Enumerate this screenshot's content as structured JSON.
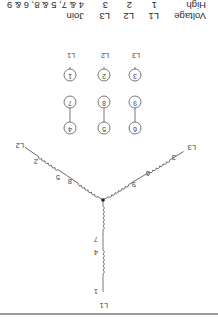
{
  "table": {
    "row_header_1": "Voltage",
    "row_header_2": "High",
    "columns": [
      {
        "line": "L1",
        "terminal": "1"
      },
      {
        "line": "L2",
        "terminal": "2"
      },
      {
        "line": "L3",
        "terminal": "3"
      }
    ],
    "join_header": "Join",
    "join_value": "4 & 7, 5 & 8, 6 & 9"
  },
  "terminals": {
    "line_labels": [
      "L1",
      "L2",
      "L3"
    ],
    "top_row": [
      "1",
      "2",
      "3"
    ],
    "middle_row": [
      "7",
      "8",
      "9"
    ],
    "bottom_row": [
      "4",
      "5",
      "6"
    ]
  },
  "wye": {
    "leg_L1": {
      "line": "L1",
      "labels": [
        "1",
        "4",
        "7"
      ]
    },
    "leg_L2": {
      "line": "L2",
      "labels": [
        "2",
        "5",
        "8"
      ]
    },
    "leg_L3": {
      "line": "L3",
      "labels": [
        "3",
        "6",
        "9"
      ]
    }
  },
  "colors": {
    "line": "#555555",
    "rule": "#7a7a7a"
  }
}
